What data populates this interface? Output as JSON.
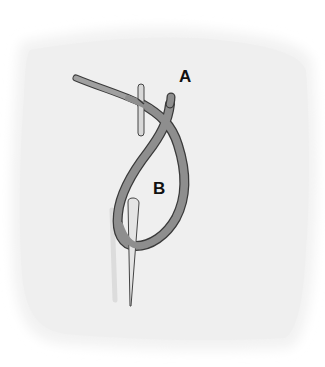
{
  "illustration": {
    "subject": "embroidery stitch diagram: thread looped around pin with needle",
    "labels": {
      "a": "A",
      "b": "B"
    },
    "colors": {
      "background": "#ffffff",
      "fabric": "#f1f1f1",
      "fabric_shadow": "#e4e4e4",
      "thread": "#8e8e8e",
      "thread_outline": "#3a3a3a",
      "pin": "#d8d8d8",
      "needle": "#e2e2e2",
      "label": "#111111"
    }
  }
}
